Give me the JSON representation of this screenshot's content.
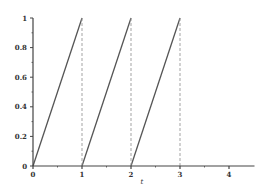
{
  "chart_data": {
    "type": "line",
    "title": "",
    "xlabel": "t",
    "ylabel": "",
    "xlim": [
      0,
      4.5
    ],
    "ylim": [
      0,
      1
    ],
    "grid": false,
    "legend": null,
    "x_ticks": [
      0,
      1,
      2,
      3,
      4
    ],
    "x_tick_labels": [
      "0",
      "1",
      "2",
      "3",
      "4"
    ],
    "x_minor_ticks": [
      0.5,
      1.5,
      2.5,
      3.5
    ],
    "y_ticks": [
      0,
      0.2,
      0.4,
      0.6,
      0.8,
      1
    ],
    "y_tick_labels": [
      "0",
      "0.2",
      "0.4",
      "0.6",
      "0.8",
      "1"
    ],
    "y_minor_ticks": [
      0.1,
      0.3,
      0.5,
      0.7,
      0.9
    ],
    "series": [
      {
        "name": "sawtooth",
        "style": "solid",
        "color": "#555555",
        "segments": [
          {
            "x": [
              0,
              1
            ],
            "y": [
              0,
              1
            ]
          },
          {
            "x": [
              1,
              2
            ],
            "y": [
              0,
              1
            ]
          },
          {
            "x": [
              2,
              3
            ],
            "y": [
              0,
              1
            ]
          }
        ]
      },
      {
        "name": "drops",
        "style": "dashed",
        "color": "#999999",
        "segments": [
          {
            "x": [
              1,
              1
            ],
            "y": [
              1,
              0
            ]
          },
          {
            "x": [
              2,
              2
            ],
            "y": [
              1,
              0
            ]
          },
          {
            "x": [
              3,
              3
            ],
            "y": [
              1,
              0
            ]
          }
        ]
      }
    ]
  },
  "colors": {
    "axis": "#444444",
    "line": "#555555",
    "dashed": "#999999"
  }
}
